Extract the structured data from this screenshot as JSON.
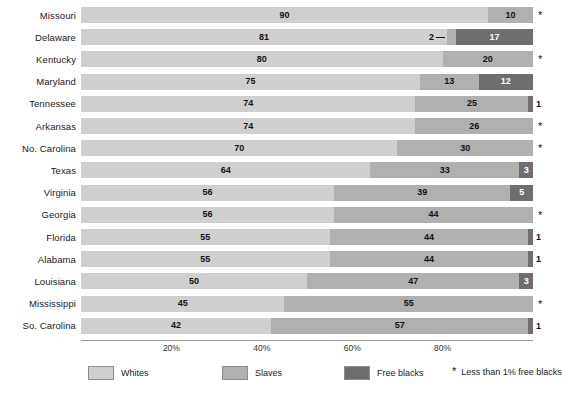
{
  "chart_data": {
    "type": "bar",
    "orientation": "horizontal",
    "stacked": true,
    "title": "",
    "xlabel": "",
    "ylabel": "",
    "xlim": [
      0,
      100
    ],
    "grid": false,
    "legend_position": "bottom",
    "xticks": [
      "20%",
      "40%",
      "60%",
      "80%"
    ],
    "xtick_values": [
      20,
      40,
      60,
      80
    ],
    "categories": [
      "Missouri",
      "Delaware",
      "Kentucky",
      "Maryland",
      "Tennessee",
      "Arkansas",
      "No. Carolina",
      "Texas",
      "Virginia",
      "Georgia",
      "Florida",
      "Alabama",
      "Louisiana",
      "Mississippi",
      "So. Carolina"
    ],
    "series": [
      {
        "name": "Whites",
        "color": "#cfcfcf",
        "values": [
          90,
          81,
          80,
          75,
          74,
          74,
          70,
          64,
          56,
          56,
          55,
          55,
          50,
          45,
          42
        ]
      },
      {
        "name": "Slaves",
        "color": "#b0b0b0",
        "values": [
          10,
          2,
          20,
          13,
          25,
          26,
          30,
          33,
          39,
          44,
          44,
          44,
          47,
          55,
          57
        ]
      },
      {
        "name": "Free blacks",
        "color": "#6e6e6e",
        "values": [
          0,
          17,
          0,
          12,
          1,
          0,
          0,
          3,
          5,
          0,
          1,
          1,
          3,
          0,
          1
        ]
      }
    ],
    "rows": [
      {
        "label": "Missouri",
        "whites": 90,
        "slaves": 10,
        "free": 0,
        "free_label": "",
        "star": true,
        "slaves_callout": false,
        "free_outside": false
      },
      {
        "label": "Delaware",
        "whites": 81,
        "slaves": 2,
        "free": 17,
        "free_label": "17",
        "star": false,
        "slaves_callout": true,
        "free_outside": false
      },
      {
        "label": "Kentucky",
        "whites": 80,
        "slaves": 20,
        "free": 0,
        "free_label": "",
        "star": true,
        "slaves_callout": false,
        "free_outside": false
      },
      {
        "label": "Maryland",
        "whites": 75,
        "slaves": 13,
        "free": 12,
        "free_label": "12",
        "star": false,
        "slaves_callout": false,
        "free_outside": false
      },
      {
        "label": "Tennessee",
        "whites": 74,
        "slaves": 25,
        "free": 1,
        "free_label": "1",
        "star": false,
        "slaves_callout": false,
        "free_outside": true
      },
      {
        "label": "Arkansas",
        "whites": 74,
        "slaves": 26,
        "free": 0,
        "free_label": "",
        "star": true,
        "slaves_callout": false,
        "free_outside": false
      },
      {
        "label": "No. Carolina",
        "whites": 70,
        "slaves": 30,
        "free": 0,
        "free_label": "",
        "star": true,
        "slaves_callout": false,
        "free_outside": false
      },
      {
        "label": "Texas",
        "whites": 64,
        "slaves": 33,
        "free": 3,
        "free_label": "3",
        "star": false,
        "slaves_callout": false,
        "free_outside": false
      },
      {
        "label": "Virginia",
        "whites": 56,
        "slaves": 39,
        "free": 5,
        "free_label": "5",
        "star": false,
        "slaves_callout": false,
        "free_outside": false
      },
      {
        "label": "Georgia",
        "whites": 56,
        "slaves": 44,
        "free": 0,
        "free_label": "",
        "star": true,
        "slaves_callout": false,
        "free_outside": false
      },
      {
        "label": "Florida",
        "whites": 55,
        "slaves": 44,
        "free": 1,
        "free_label": "1",
        "star": false,
        "slaves_callout": false,
        "free_outside": true
      },
      {
        "label": "Alabama",
        "whites": 55,
        "slaves": 44,
        "free": 1,
        "free_label": "1",
        "star": false,
        "slaves_callout": false,
        "free_outside": true
      },
      {
        "label": "Louisiana",
        "whites": 50,
        "slaves": 47,
        "free": 3,
        "free_label": "3",
        "star": false,
        "slaves_callout": false,
        "free_outside": false
      },
      {
        "label": "Mississippi",
        "whites": 45,
        "slaves": 55,
        "free": 0,
        "free_label": "",
        "star": true,
        "slaves_callout": false,
        "free_outside": false
      },
      {
        "label": "So. Carolina",
        "whites": 42,
        "slaves": 57,
        "free": 1,
        "free_label": "1",
        "star": false,
        "slaves_callout": false,
        "free_outside": true
      }
    ]
  },
  "legend": {
    "items": [
      {
        "label": "Whites",
        "color": "#cfcfcf"
      },
      {
        "label": "Slaves",
        "color": "#b0b0b0"
      },
      {
        "label": "Free blacks",
        "color": "#6e6e6e"
      }
    ],
    "note_symbol": "*",
    "note_text": "Less than 1% free blacks"
  },
  "symbols": {
    "star": "*",
    "dash": "—"
  }
}
